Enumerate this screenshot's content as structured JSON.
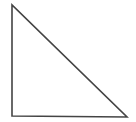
{
  "figure": {
    "name": "right-triangle",
    "type": "geometric-shape",
    "canvas": {
      "width": 136,
      "height": 122,
      "background_color": "#ffffff"
    },
    "style": {
      "stroke_color": "#444444",
      "stroke_width": 1.6,
      "fill_color": "none",
      "line_join": "miter",
      "line_cap": "butt"
    },
    "vertices": [
      {
        "name": "apex-top-left",
        "x": 12,
        "y": 5
      },
      {
        "name": "right-angle-bottom-left",
        "x": 12,
        "y": 116
      },
      {
        "name": "vertex-bottom-right",
        "x": 127,
        "y": 117
      }
    ],
    "edges": [
      {
        "name": "left-leg-vertical",
        "from": "apex-top-left",
        "to": "right-angle-bottom-left"
      },
      {
        "name": "bottom-leg-horizontal",
        "from": "right-angle-bottom-left",
        "to": "vertex-bottom-right"
      },
      {
        "name": "hypotenuse",
        "from": "vertex-bottom-right",
        "to": "apex-top-left"
      }
    ],
    "path": "M 12 5 L 12 116 L 127 117 Z",
    "labels": []
  }
}
